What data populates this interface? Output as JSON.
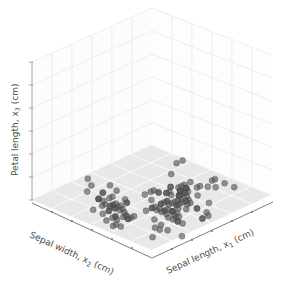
{
  "figure": {
    "background_color": "#ffffff",
    "width": 281,
    "height": 294
  },
  "axes": {
    "x_axis": {
      "name": "Sepal length",
      "symbol": "x",
      "subscript": "1",
      "unit": "(cm)",
      "label": "Sepal length, x₁ (cm)",
      "label_prefix": "Sepal length, x",
      "label_suffix": " (cm)",
      "ticks": 6,
      "tick_labels": []
    },
    "y_axis": {
      "name": "Sepal width",
      "symbol": "x",
      "subscript": "2",
      "unit": "(cm)",
      "label": "Sepal width, x₂ (cm)",
      "label_prefix": "Sepal width, x",
      "label_suffix": " (cm)",
      "ticks": 6,
      "tick_labels": []
    },
    "z_axis": {
      "name": "Petal length",
      "symbol": "x",
      "subscript": "3",
      "unit": "(cm)",
      "label": "Petal length, x₃ (cm)",
      "label_prefix": "Petal length, x",
      "label_suffix": " (cm)",
      "ticks": 6,
      "tick_labels": []
    }
  },
  "style": {
    "pane_floor_color": "#e8e8e8",
    "pane_wall_color": "#fcfcfc",
    "grid_floor_color": "#ffffff",
    "grid_wall_color": "#e4e4e4",
    "spine_color": "#9a9a9a",
    "axis_spine_dark": "#6e6e6e",
    "marker_color": "#555555",
    "marker_edge_color": "#3f3f3f",
    "marker_opacity": 0.62,
    "marker_radius": 3.0,
    "label_color": "#4d4d4d"
  },
  "chart_data": {
    "type": "scatter",
    "dimensions": 3,
    "title": "",
    "xlabel": "Sepal length, x₁ (cm)",
    "ylabel": "Sepal width, x₂ (cm)",
    "zlabel": "Petal length, x₃ (cm)",
    "grid": true,
    "legend": null,
    "xlim": [
      4.0,
      8.0
    ],
    "ylim": [
      2.0,
      4.5
    ],
    "zlim": [
      0.0,
      7.0
    ],
    "projection": {
      "type": "orthographic-3d",
      "origin_front": [
        152,
        250
      ],
      "corner_left": [
        32,
        200
      ],
      "corner_right": [
        272,
        195
      ],
      "corner_back": [
        152,
        145
      ],
      "top_front": [
        152,
        8
      ],
      "top_left": [
        32,
        62
      ],
      "top_right": [
        272,
        55
      ]
    },
    "note": "All markers lie on the z = 0 floor plane (petal length projected to base).",
    "series": [
      {
        "name": "iris samples",
        "color": "#555555",
        "points": [
          [
            5.1,
            3.5,
            0
          ],
          [
            4.9,
            3.0,
            0
          ],
          [
            4.7,
            3.2,
            0
          ],
          [
            4.6,
            3.1,
            0
          ],
          [
            5.0,
            3.6,
            0
          ],
          [
            5.4,
            3.9,
            0
          ],
          [
            4.6,
            3.4,
            0
          ],
          [
            5.0,
            3.4,
            0
          ],
          [
            4.4,
            2.9,
            0
          ],
          [
            4.9,
            3.1,
            0
          ],
          [
            5.4,
            3.7,
            0
          ],
          [
            4.8,
            3.4,
            0
          ],
          [
            4.8,
            3.0,
            0
          ],
          [
            4.3,
            3.0,
            0
          ],
          [
            5.8,
            4.0,
            0
          ],
          [
            5.7,
            4.4,
            0
          ],
          [
            5.4,
            3.9,
            0
          ],
          [
            5.1,
            3.5,
            0
          ],
          [
            5.7,
            3.8,
            0
          ],
          [
            5.1,
            3.8,
            0
          ],
          [
            5.4,
            3.4,
            0
          ],
          [
            5.1,
            3.7,
            0
          ],
          [
            4.6,
            3.6,
            0
          ],
          [
            5.1,
            3.3,
            0
          ],
          [
            4.8,
            3.4,
            0
          ],
          [
            5.0,
            3.0,
            0
          ],
          [
            5.0,
            3.4,
            0
          ],
          [
            5.2,
            3.5,
            0
          ],
          [
            5.2,
            3.4,
            0
          ],
          [
            4.7,
            3.2,
            0
          ],
          [
            4.8,
            3.1,
            0
          ],
          [
            5.4,
            3.4,
            0
          ],
          [
            5.2,
            4.1,
            0
          ],
          [
            5.5,
            4.2,
            0
          ],
          [
            4.9,
            3.1,
            0
          ],
          [
            5.0,
            3.2,
            0
          ],
          [
            5.5,
            3.5,
            0
          ],
          [
            4.9,
            3.6,
            0
          ],
          [
            4.4,
            3.0,
            0
          ],
          [
            5.1,
            3.4,
            0
          ],
          [
            5.0,
            3.5,
            0
          ],
          [
            4.5,
            2.3,
            0
          ],
          [
            4.4,
            3.2,
            0
          ],
          [
            5.0,
            3.5,
            0
          ],
          [
            5.1,
            3.8,
            0
          ],
          [
            4.8,
            3.0,
            0
          ],
          [
            5.1,
            3.8,
            0
          ],
          [
            4.6,
            3.2,
            0
          ],
          [
            5.3,
            3.7,
            0
          ],
          [
            5.0,
            3.3,
            0
          ],
          [
            7.0,
            3.2,
            0
          ],
          [
            6.4,
            3.2,
            0
          ],
          [
            6.9,
            3.1,
            0
          ],
          [
            5.5,
            2.3,
            0
          ],
          [
            6.5,
            2.8,
            0
          ],
          [
            5.7,
            2.8,
            0
          ],
          [
            6.3,
            3.3,
            0
          ],
          [
            4.9,
            2.4,
            0
          ],
          [
            6.6,
            2.9,
            0
          ],
          [
            5.2,
            2.7,
            0
          ],
          [
            5.0,
            2.0,
            0
          ],
          [
            5.9,
            3.0,
            0
          ],
          [
            6.0,
            2.2,
            0
          ],
          [
            6.1,
            2.9,
            0
          ],
          [
            5.6,
            2.9,
            0
          ],
          [
            6.7,
            3.1,
            0
          ],
          [
            5.6,
            3.0,
            0
          ],
          [
            5.8,
            2.7,
            0
          ],
          [
            6.2,
            2.2,
            0
          ],
          [
            5.6,
            2.5,
            0
          ],
          [
            5.9,
            3.2,
            0
          ],
          [
            6.1,
            2.8,
            0
          ],
          [
            6.3,
            2.5,
            0
          ],
          [
            6.1,
            2.8,
            0
          ],
          [
            6.4,
            2.9,
            0
          ],
          [
            6.6,
            3.0,
            0
          ],
          [
            6.8,
            2.8,
            0
          ],
          [
            6.7,
            3.0,
            0
          ],
          [
            6.0,
            2.9,
            0
          ],
          [
            5.7,
            2.6,
            0
          ],
          [
            5.5,
            2.4,
            0
          ],
          [
            5.5,
            2.4,
            0
          ],
          [
            5.8,
            2.7,
            0
          ],
          [
            6.0,
            2.7,
            0
          ],
          [
            5.4,
            3.0,
            0
          ],
          [
            6.0,
            3.4,
            0
          ],
          [
            6.7,
            3.1,
            0
          ],
          [
            6.3,
            2.3,
            0
          ],
          [
            5.6,
            3.0,
            0
          ],
          [
            5.5,
            2.5,
            0
          ],
          [
            5.5,
            2.6,
            0
          ],
          [
            6.1,
            3.0,
            0
          ],
          [
            5.8,
            2.6,
            0
          ],
          [
            5.0,
            2.3,
            0
          ],
          [
            5.6,
            2.7,
            0
          ],
          [
            5.7,
            3.0,
            0
          ],
          [
            5.7,
            2.9,
            0
          ],
          [
            6.2,
            2.9,
            0
          ],
          [
            5.1,
            2.5,
            0
          ],
          [
            5.7,
            2.8,
            0
          ],
          [
            6.3,
            3.3,
            0
          ],
          [
            5.8,
            2.7,
            0
          ],
          [
            7.1,
            3.0,
            0
          ],
          [
            6.3,
            2.9,
            0
          ],
          [
            6.5,
            3.0,
            0
          ],
          [
            7.6,
            3.0,
            0
          ],
          [
            4.9,
            2.5,
            0
          ],
          [
            7.3,
            2.9,
            0
          ],
          [
            6.7,
            2.5,
            0
          ],
          [
            7.2,
            3.6,
            0
          ],
          [
            6.5,
            3.2,
            0
          ],
          [
            6.4,
            2.7,
            0
          ],
          [
            6.8,
            3.0,
            0
          ],
          [
            5.7,
            2.5,
            0
          ],
          [
            5.8,
            2.8,
            0
          ],
          [
            6.4,
            3.2,
            0
          ],
          [
            6.5,
            3.0,
            0
          ],
          [
            7.7,
            3.8,
            0
          ],
          [
            7.7,
            2.6,
            0
          ],
          [
            6.0,
            2.2,
            0
          ],
          [
            6.9,
            3.2,
            0
          ],
          [
            5.6,
            2.8,
            0
          ],
          [
            7.7,
            2.8,
            0
          ],
          [
            6.3,
            2.7,
            0
          ],
          [
            6.7,
            3.3,
            0
          ],
          [
            7.2,
            3.2,
            0
          ],
          [
            6.2,
            2.8,
            0
          ],
          [
            6.1,
            3.0,
            0
          ],
          [
            6.4,
            2.8,
            0
          ],
          [
            7.2,
            3.0,
            0
          ],
          [
            7.4,
            2.8,
            0
          ],
          [
            7.9,
            3.8,
            0
          ],
          [
            6.4,
            2.8,
            0
          ],
          [
            6.3,
            2.8,
            0
          ],
          [
            6.1,
            2.6,
            0
          ],
          [
            7.7,
            3.0,
            0
          ],
          [
            6.3,
            3.4,
            0
          ],
          [
            6.4,
            3.1,
            0
          ],
          [
            6.0,
            3.0,
            0
          ],
          [
            6.9,
            3.1,
            0
          ],
          [
            6.7,
            3.1,
            0
          ],
          [
            6.9,
            3.1,
            0
          ],
          [
            5.8,
            2.7,
            0
          ],
          [
            6.8,
            3.2,
            0
          ],
          [
            6.7,
            3.3,
            0
          ],
          [
            6.7,
            3.0,
            0
          ],
          [
            6.3,
            2.5,
            0
          ],
          [
            6.5,
            3.0,
            0
          ],
          [
            6.2,
            3.4,
            0
          ],
          [
            5.9,
            3.0,
            0
          ]
        ]
      }
    ]
  }
}
